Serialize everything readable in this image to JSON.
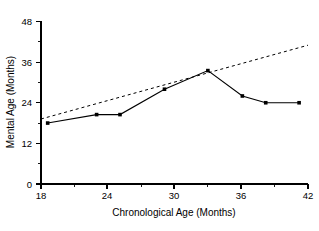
{
  "chart_data": {
    "type": "line",
    "title": "",
    "xlabel": "Chronological Age (Months)",
    "ylabel": "Mental Age (Months)",
    "xlim": [
      18,
      42
    ],
    "ylim": [
      0,
      48
    ],
    "xticks": [
      18,
      24,
      30,
      36,
      42
    ],
    "yticks": [
      0,
      12,
      24,
      36,
      48
    ],
    "xtick_labels": [
      "18",
      "24",
      "30",
      "36",
      "42"
    ],
    "ytick_labels": [
      "0",
      "12",
      "24",
      "36",
      "48"
    ],
    "x_minor_ticks": [
      21,
      27,
      33,
      39
    ],
    "y_minor_ticks": [
      6,
      18,
      30,
      42
    ],
    "grid": false,
    "legend": null,
    "series": [
      {
        "name": "Observed mental age",
        "style": "solid",
        "marker": "square",
        "points": [
          {
            "x": 18.6,
            "y": 18.0
          },
          {
            "x": 23.0,
            "y": 20.5
          },
          {
            "x": 25.1,
            "y": 20.5
          },
          {
            "x": 29.1,
            "y": 28.0
          },
          {
            "x": 33.0,
            "y": 33.5
          },
          {
            "x": 36.1,
            "y": 26.0
          },
          {
            "x": 38.2,
            "y": 24.0
          },
          {
            "x": 41.2,
            "y": 24.0
          }
        ]
      },
      {
        "name": "Normal development reference",
        "style": "dashed",
        "marker": "none",
        "points": [
          {
            "x": 18.0,
            "y": 19.2
          },
          {
            "x": 42.0,
            "y": 41.0
          }
        ]
      }
    ]
  }
}
